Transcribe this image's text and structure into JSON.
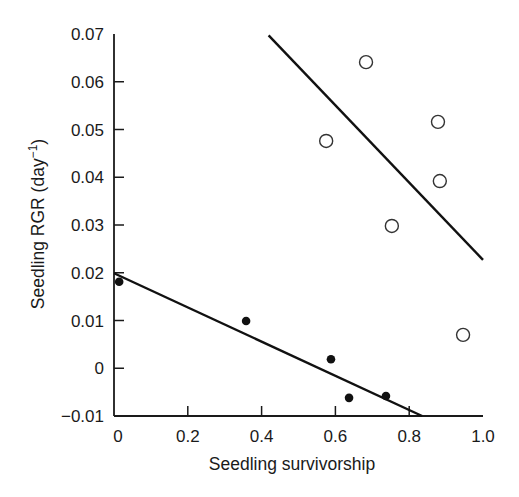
{
  "chart_data": {
    "type": "scatter",
    "title": "",
    "xlabel": "Seedling survivorship",
    "ylabel": "Seedling RGR (day",
    "ylabel_superscript": "−1",
    "ylabel_close": ")",
    "xlim": [
      0,
      1.0
    ],
    "ylim": [
      -0.01,
      0.07
    ],
    "x_ticks": [
      "0",
      "0.2",
      "0.4",
      "0.6",
      "0.8",
      "1.0"
    ],
    "x_tick_values": [
      0,
      0.2,
      0.4,
      0.6,
      0.8,
      1.0
    ],
    "y_ticks": [
      "0.07",
      "0.06",
      "0.05",
      "0.04",
      "0.03",
      "0.02",
      "0.01",
      "0",
      "−0.01"
    ],
    "y_tick_values": [
      0.07,
      0.06,
      0.05,
      0.04,
      0.03,
      0.02,
      0.01,
      0,
      -0.01
    ],
    "grid": false,
    "legend": null,
    "series": [
      {
        "name": "open circles",
        "marker": "open-circle",
        "color": "#333333",
        "points": [
          {
            "x": 0.575,
            "y": 0.0476
          },
          {
            "x": 0.683,
            "y": 0.0641
          },
          {
            "x": 0.878,
            "y": 0.0516
          },
          {
            "x": 0.883,
            "y": 0.0392
          },
          {
            "x": 0.753,
            "y": 0.0298
          },
          {
            "x": 0.946,
            "y": 0.007
          }
        ],
        "fit_line": {
          "x1": 0.419,
          "y1": 0.0697,
          "x2": 1.0,
          "y2": 0.0227
        }
      },
      {
        "name": "filled circles",
        "marker": "filled-circle",
        "color": "#111111",
        "points": [
          {
            "x": 0.014,
            "y": 0.0181
          },
          {
            "x": 0.358,
            "y": 0.0099
          },
          {
            "x": 0.588,
            "y": 0.0019
          },
          {
            "x": 0.637,
            "y": -0.0062
          },
          {
            "x": 0.737,
            "y": -0.0058
          }
        ],
        "fit_line": {
          "x1": 0.0,
          "y1": 0.0199,
          "x2": 0.835,
          "y2": -0.01
        }
      }
    ]
  },
  "colors": {
    "axis": "#1a1a1a",
    "line": "#111111",
    "background": "#ffffff"
  }
}
